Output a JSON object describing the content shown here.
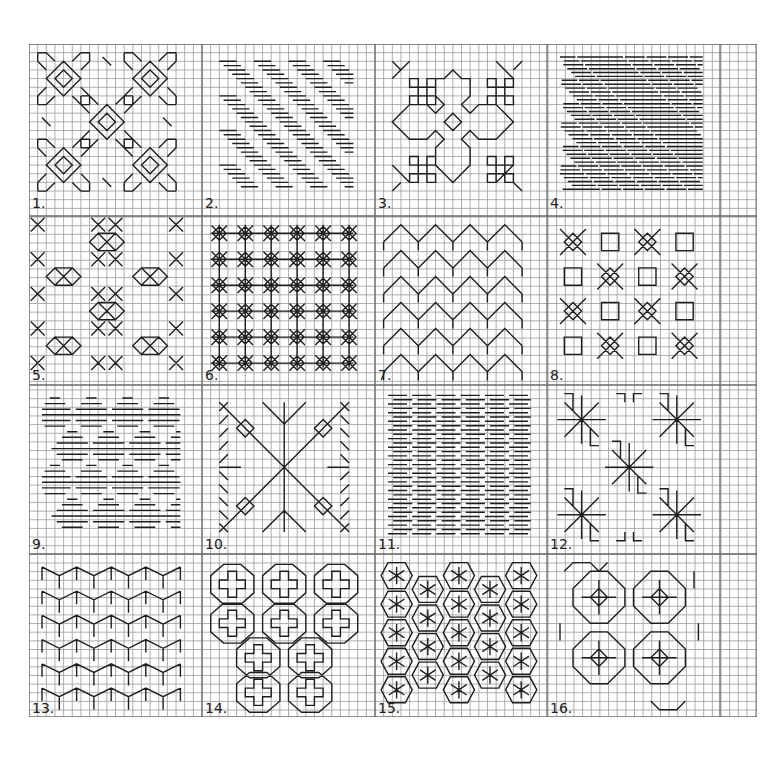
{
  "sheet": {
    "cell_px": 8.65,
    "cols": 84,
    "rows": 78,
    "grid_color": "#9a9a9a",
    "divider_color": "#6a6a6a",
    "stitch_color": "#1e1e1e",
    "panel_cols": 20,
    "panel_rows": 19.5
  },
  "panels": [
    {
      "label": "1.",
      "name": "diamond-arrow-motifs",
      "type": "arrows"
    },
    {
      "label": "2.",
      "name": "diagonal-dash-bands",
      "type": "dashdiag"
    },
    {
      "label": "3.",
      "name": "star-and-block-medallion",
      "type": "medallion"
    },
    {
      "label": "4.",
      "name": "dense-diagonal-dashes",
      "type": "densedash"
    },
    {
      "label": "5.",
      "name": "linked-diamond-chains",
      "type": "chains"
    },
    {
      "label": "6.",
      "name": "crossed-grid-stars",
      "type": "crossgrid"
    },
    {
      "label": "7.",
      "name": "zigzag-steps",
      "type": "zigzag"
    },
    {
      "label": "8.",
      "name": "squares-and-crosses",
      "type": "squarecross"
    },
    {
      "label": "9.",
      "name": "stacked-dash-diamonds",
      "type": "dashdiamond"
    },
    {
      "label": "10.",
      "name": "radiating-leaf-star",
      "type": "leafstar"
    },
    {
      "label": "11.",
      "name": "horizontal-dash-columns",
      "type": "hdash"
    },
    {
      "label": "12.",
      "name": "fan-flower-rosettes",
      "type": "fans"
    },
    {
      "label": "13.",
      "name": "chevron-rows",
      "type": "chevron"
    },
    {
      "label": "14.",
      "name": "greek-cross-octagons",
      "type": "crossoct"
    },
    {
      "label": "15.",
      "name": "hexagon-asterisks",
      "type": "hexstar"
    },
    {
      "label": "16.",
      "name": "octagon-rings",
      "type": "octrings"
    }
  ]
}
